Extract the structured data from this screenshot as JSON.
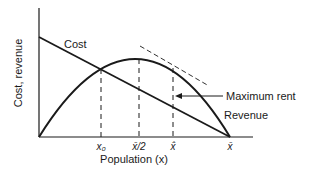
{
  "diagram": {
    "ylabel": "Cost, revenue",
    "xlabel": "Population (x)",
    "curves": {
      "cost_label": "Cost",
      "revenue_label": "Revenue"
    },
    "annotation": {
      "max_rent_label": "Maximum rent"
    },
    "ticks": [
      {
        "id": "x0",
        "label": "x₀"
      },
      {
        "id": "xbar_half",
        "label": "x̄/2"
      },
      {
        "id": "xhat",
        "label": "x̂"
      },
      {
        "id": "xbar",
        "label": "x̄"
      }
    ],
    "colors": {
      "ink": "#1a1a1a",
      "background": "#ffffff"
    }
  }
}
